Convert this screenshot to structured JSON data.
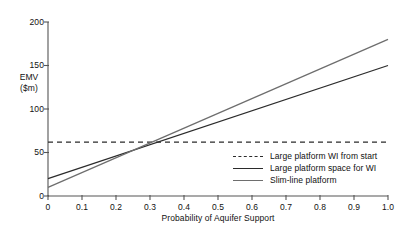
{
  "chart_data": {
    "type": "line",
    "title": "",
    "xlabel": "Probability of Aquifer Support",
    "ylabel_line1": "EMV",
    "ylabel_line2": "($m)",
    "xlim": [
      0,
      1.0
    ],
    "ylim": [
      0,
      200
    ],
    "grid": false,
    "legend_position": "inside-lower-right",
    "x_ticks": [
      "0",
      "0.1",
      "0.2",
      "0.3",
      "0.4",
      "0.5",
      "0.6",
      "0.7",
      "0.8",
      "0.9",
      "1.0"
    ],
    "x_tick_values": [
      0,
      0.1,
      0.2,
      0.3,
      0.4,
      0.5,
      0.6,
      0.7,
      0.8,
      0.9,
      1.0
    ],
    "y_ticks": [
      "0",
      "50",
      "100",
      "150",
      "200"
    ],
    "y_tick_values": [
      0,
      50,
      100,
      150,
      200
    ],
    "series": [
      {
        "name": "Large platform WI from start",
        "style": "dashed",
        "color": "#2b2b2b",
        "x": [
          0,
          1.0
        ],
        "values": [
          62,
          62
        ]
      },
      {
        "name": "Large platform space for WI",
        "style": "solid",
        "color": "#2b2b2b",
        "x": [
          0,
          1.0
        ],
        "values": [
          20,
          150
        ]
      },
      {
        "name": "Slim-line platform",
        "style": "solid",
        "color": "#6e6e6e",
        "x": [
          0,
          1.0
        ],
        "values": [
          10,
          180
        ]
      }
    ],
    "annotations": []
  },
  "legend": {
    "items": [
      {
        "label": "Large platform WI from start"
      },
      {
        "label": "Large platform space for WI"
      },
      {
        "label": "Slim-line platform"
      }
    ]
  },
  "axes": {
    "y_labels": [
      "200",
      "150",
      "100",
      "50",
      "0"
    ],
    "x_labels": [
      "0",
      "0.1",
      "0.2",
      "0.3",
      "0.4",
      "0.5",
      "0.6",
      "0.7",
      "0.8",
      "0.9",
      "1.0"
    ],
    "x_title": "Probability of Aquifer Support",
    "y_title_line1": "EMV",
    "y_title_line2": "($m)"
  },
  "colors": {
    "axis": "#555555",
    "series_dark": "#2b2b2b",
    "series_light": "#6e6e6e",
    "text": "#111111",
    "background": "#ffffff"
  }
}
